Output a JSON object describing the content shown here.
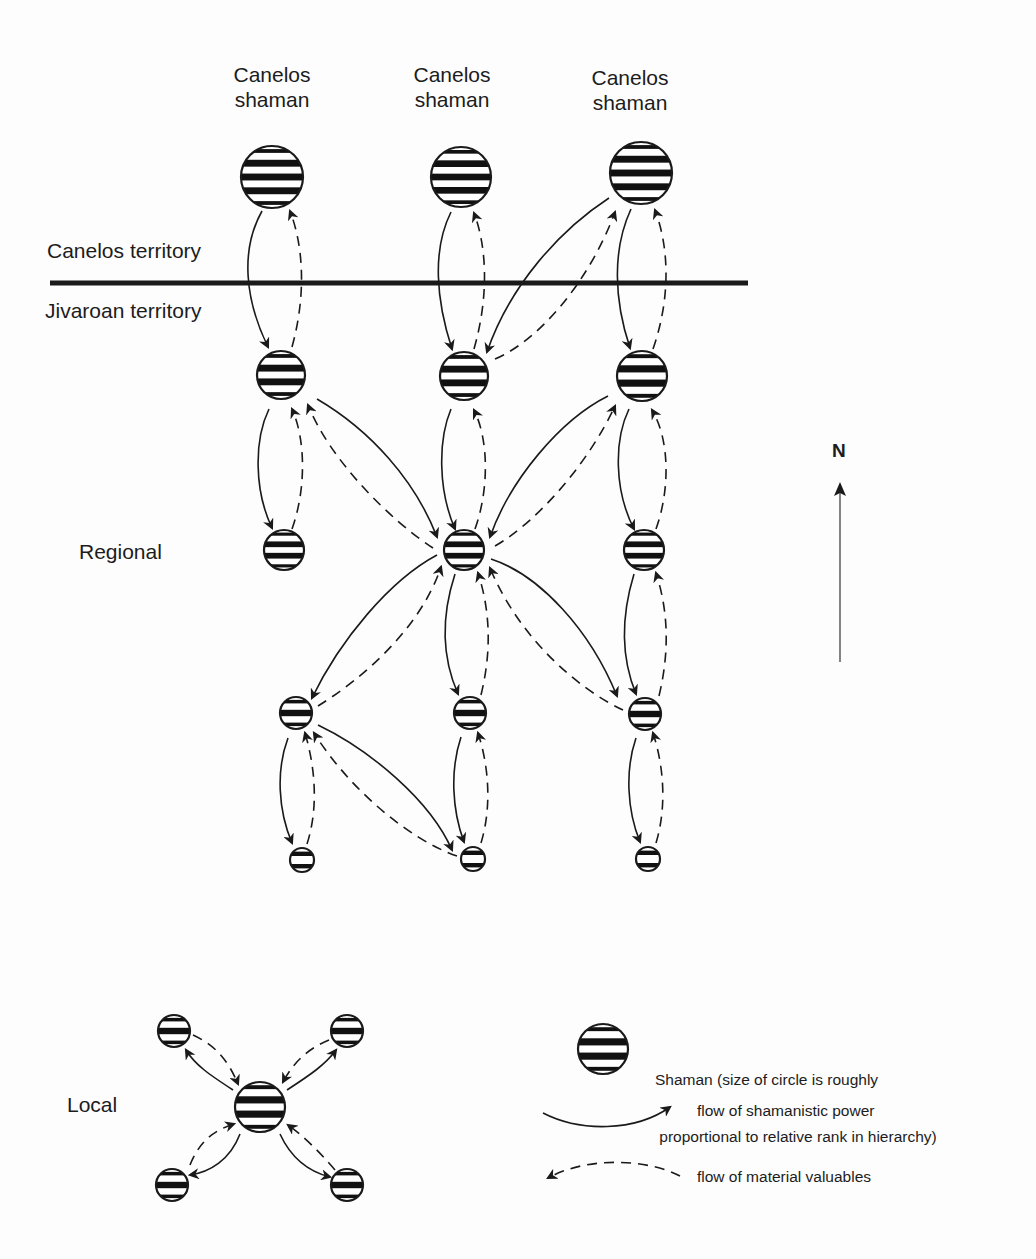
{
  "diagram": {
    "colors": {
      "ink": "#1a1a1a",
      "background": "#fdfdfd",
      "stripe": "#111111"
    },
    "top_labels": [
      {
        "line1": "Canelos",
        "line2": "shaman",
        "x": 272,
        "y": 62
      },
      {
        "line1": "Canelos",
        "line2": "shaman",
        "x": 452,
        "y": 62
      },
      {
        "line1": "Canelos",
        "line2": "shaman",
        "x": 630,
        "y": 65
      }
    ],
    "territory": {
      "upper_label": "Canelos territory",
      "lower_label": "Jivaroan territory",
      "boundary": {
        "x1": 50,
        "y1": 283,
        "x2": 748,
        "y2": 283
      }
    },
    "level_labels": {
      "regional": "Regional",
      "local": "Local"
    },
    "north_arrow": {
      "label": "N"
    },
    "legend": {
      "shaman_line1": "Shaman (size of circle is roughly",
      "shaman_line2": " proportional to relative rank in hierarchy)",
      "power_label": "flow of shamanistic power",
      "valuables_label": "flow of material valuables"
    },
    "nodes": [
      {
        "id": "c1",
        "x": 272,
        "y": 177,
        "r": 31
      },
      {
        "id": "c2",
        "x": 461,
        "y": 177,
        "r": 30
      },
      {
        "id": "c3",
        "x": 641,
        "y": 173,
        "r": 31
      },
      {
        "id": "j1",
        "x": 281,
        "y": 375,
        "r": 24
      },
      {
        "id": "j2",
        "x": 464,
        "y": 376,
        "r": 24
      },
      {
        "id": "j3",
        "x": 642,
        "y": 376,
        "r": 25
      },
      {
        "id": "r1",
        "x": 284,
        "y": 550,
        "r": 20
      },
      {
        "id": "r2",
        "x": 464,
        "y": 550,
        "r": 20
      },
      {
        "id": "r3",
        "x": 644,
        "y": 550,
        "r": 20
      },
      {
        "id": "m1",
        "x": 296,
        "y": 713,
        "r": 16
      },
      {
        "id": "m2",
        "x": 470,
        "y": 713,
        "r": 16
      },
      {
        "id": "m3",
        "x": 645,
        "y": 714,
        "r": 16
      },
      {
        "id": "s1",
        "x": 302,
        "y": 860,
        "r": 12
      },
      {
        "id": "s2",
        "x": 473,
        "y": 859,
        "r": 12
      },
      {
        "id": "s3",
        "x": 648,
        "y": 859,
        "r": 12
      },
      {
        "id": "lc",
        "x": 260,
        "y": 1107,
        "r": 25
      },
      {
        "id": "ltl",
        "x": 174,
        "y": 1031,
        "r": 16
      },
      {
        "id": "ltr",
        "x": 347,
        "y": 1031,
        "r": 16
      },
      {
        "id": "lbl",
        "x": 172,
        "y": 1185,
        "r": 16
      },
      {
        "id": "lbr",
        "x": 347,
        "y": 1185,
        "r": 16
      },
      {
        "id": "legend_shaman",
        "x": 603,
        "y": 1049,
        "r": 25
      }
    ],
    "power_flows": [
      {
        "from": "c1",
        "to": "j1",
        "path": "M262,211 C240,250 245,300 268,347"
      },
      {
        "from": "c2",
        "to": "j2",
        "path": "M451,212 C432,250 436,300 452,349"
      },
      {
        "from": "c3",
        "to": "j3",
        "path": "M631,209 C612,250 614,300 630,348"
      },
      {
        "from": "c3",
        "to": "j2",
        "path": "M609,198 C560,230 510,285 487,352"
      },
      {
        "from": "j1",
        "to": "r1",
        "path": "M269,409 C254,440 254,490 272,528"
      },
      {
        "from": "j2",
        "to": "r2",
        "path": "M451,409 C438,440 438,490 455,529"
      },
      {
        "from": "j3",
        "to": "r3",
        "path": "M629,409 C614,440 614,490 634,529"
      },
      {
        "from": "j1",
        "to": "r2",
        "path": "M317,399 C370,430 415,480 437,537"
      },
      {
        "from": "j3",
        "to": "r2",
        "path": "M608,396 C560,420 510,480 490,537"
      },
      {
        "from": "r2",
        "to": "m1",
        "path": "M437,555 C390,580 340,640 312,698"
      },
      {
        "from": "r2",
        "to": "m2",
        "path": "M455,574 C440,620 443,660 458,694"
      },
      {
        "from": "r2",
        "to": "m3",
        "path": "M491,559 C540,575 590,630 617,696"
      },
      {
        "from": "r3",
        "to": "m3",
        "path": "M634,574 C620,620 622,660 636,694"
      },
      {
        "from": "m1",
        "to": "s1",
        "path": "M288,738 C276,770 278,810 292,843"
      },
      {
        "from": "m2",
        "to": "s2",
        "path": "M461,737 C450,770 452,810 464,842"
      },
      {
        "from": "m3",
        "to": "s3",
        "path": "M636,738 C625,770 627,810 640,842"
      },
      {
        "from": "m1",
        "to": "s2",
        "path": "M318,725 C370,750 430,800 452,850"
      },
      {
        "from": "lc",
        "to": "ltl",
        "path": "M233,1090 C210,1075 195,1065 186,1050"
      },
      {
        "from": "lc",
        "to": "ltr",
        "path": "M287,1090 C310,1075 325,1065 336,1050"
      },
      {
        "from": "lc",
        "to": "lbl",
        "path": "M240,1134 C230,1160 210,1172 190,1175"
      },
      {
        "from": "lc",
        "to": "lbr",
        "path": "M280,1134 C292,1160 310,1172 330,1177"
      },
      {
        "from": "legend",
        "to": "legend",
        "path": "M543,1113 C580,1132 635,1132 670,1107"
      }
    ],
    "valuable_flows": [
      {
        "from": "j1",
        "to": "c1",
        "path": "M292,347 C305,300 305,250 290,211"
      },
      {
        "from": "j2",
        "to": "c2",
        "path": "M474,349 C488,300 488,250 474,213"
      },
      {
        "from": "j3",
        "to": "c3",
        "path": "M653,349 C670,300 670,250 655,210"
      },
      {
        "from": "j2",
        "to": "c3",
        "path": "M495,359 C540,340 590,280 615,212"
      },
      {
        "from": "r1",
        "to": "j1",
        "path": "M292,529 C306,490 306,440 292,409"
      },
      {
        "from": "r2",
        "to": "j2",
        "path": "M475,529 C489,490 489,440 474,410"
      },
      {
        "from": "r3",
        "to": "j3",
        "path": "M656,529 C670,490 670,440 652,410"
      },
      {
        "from": "r2",
        "to": "j1",
        "path": "M433,548 C390,520 330,460 308,405"
      },
      {
        "from": "r2",
        "to": "j3",
        "path": "M495,546 C540,520 590,460 615,406"
      },
      {
        "from": "m1",
        "to": "r2",
        "path": "M318,706 C360,680 420,630 441,567"
      },
      {
        "from": "m2",
        "to": "r2",
        "path": "M481,695 C492,650 490,610 478,573"
      },
      {
        "from": "m3",
        "to": "r2",
        "path": "M623,710 C580,690 520,640 490,568"
      },
      {
        "from": "m3",
        "to": "r3",
        "path": "M659,696 C670,650 668,610 656,573"
      },
      {
        "from": "s1",
        "to": "m1",
        "path": "M307,844 C318,810 316,770 305,733"
      },
      {
        "from": "s2",
        "to": "m2",
        "path": "M481,843 C491,810 490,770 478,733"
      },
      {
        "from": "s3",
        "to": "m3",
        "path": "M656,843 C666,810 665,770 653,733"
      },
      {
        "from": "s2",
        "to": "m1",
        "path": "M457,856 C410,840 350,790 314,733"
      },
      {
        "from": "ltl",
        "to": "lc",
        "path": "M193,1035 C215,1045 228,1060 238,1084"
      },
      {
        "from": "ltr",
        "to": "lc",
        "path": "M329,1040 C305,1050 292,1065 283,1082"
      },
      {
        "from": "lbl",
        "to": "lc",
        "path": "M190,1165 C200,1140 215,1130 234,1124"
      },
      {
        "from": "lbr",
        "to": "lc",
        "path": "M335,1170 C318,1150 302,1135 288,1125"
      },
      {
        "from": "legend",
        "to": "legend",
        "path": "M680,1176 C650,1160 590,1155 548,1178"
      }
    ]
  }
}
